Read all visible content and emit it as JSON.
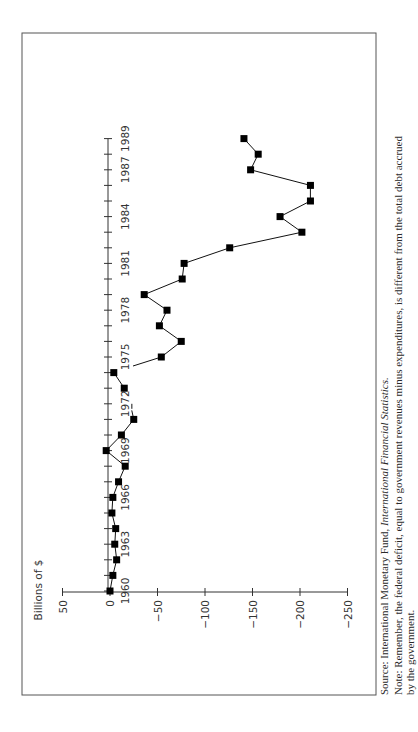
{
  "chart_data": {
    "type": "line",
    "orientation": "rotated 90 degrees counterclockwise (years run bottom-to-top, values run left-to-right)",
    "title": "",
    "ylabel": "Billions of $",
    "xlabel": "",
    "x": [
      1960,
      1961,
      1962,
      1963,
      1964,
      1965,
      1966,
      1967,
      1968,
      1969,
      1970,
      1971,
      1972,
      1973,
      1974,
      1975,
      1976,
      1977,
      1978,
      1979,
      1980,
      1981,
      1982,
      1983,
      1984,
      1985,
      1986,
      1987,
      1988,
      1989
    ],
    "series": [
      {
        "name": "Federal deficit",
        "values": [
          0,
          -3,
          -7,
          -5,
          -6,
          -2,
          -3,
          -9,
          -16,
          4,
          -12,
          -25,
          -23,
          -15,
          -4,
          -54,
          -75,
          -52,
          -60,
          -36,
          -76,
          -78,
          -126,
          -202,
          -179,
          -211,
          -211,
          -148,
          -156,
          -141
        ]
      }
    ],
    "x_tick_labels": [
      "1960",
      "1963",
      "1966",
      "1969",
      "1972",
      "1975",
      "1978",
      "1981",
      "1984",
      "1987",
      "1989"
    ],
    "y_ticks": [
      50,
      0,
      -50,
      -100,
      -150,
      -200,
      -250
    ],
    "y_tick_labels": [
      "50",
      "0",
      "−50",
      "−100",
      "−150",
      "−200",
      "−250"
    ],
    "ylim": [
      -250,
      50
    ],
    "xlim": [
      1960,
      1989
    ],
    "grid": false,
    "legend": null,
    "annotations": [
      "1972 marker missing (short line segment only)"
    ]
  },
  "labels": {
    "ylabel": "Billions of $",
    "source_prefix": "Source: International Monetary Fund, ",
    "source_italic": "International Financial Statistics.",
    "note_line1": "Note: Remember, the federal deficit, equal to government revenues minus expenditures, is different from the total debt accrued",
    "note_line2": "by the government."
  }
}
